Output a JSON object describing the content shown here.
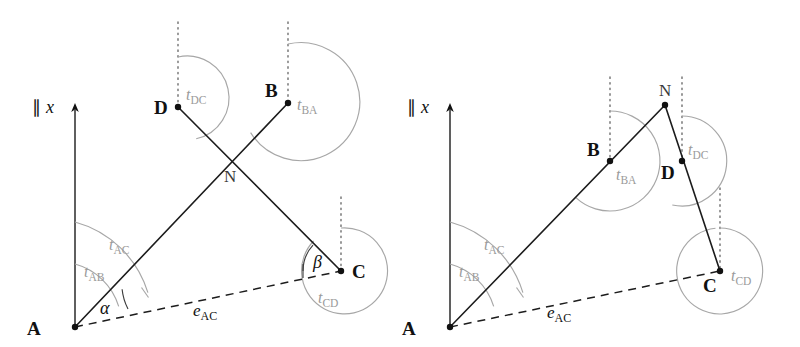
{
  "figure": {
    "background_color": "#ffffff",
    "line_color": "#1c1c1c",
    "arc_color": "#a7a7a7",
    "label_gray": "#9a9a9a",
    "panel_count": 2
  },
  "panels": [
    {
      "id": "left",
      "name": "left-panel",
      "axis_label": {
        "parallel_symbol": "∥",
        "variable": "x"
      },
      "points": [
        {
          "id": "A",
          "label": "A",
          "x": 75,
          "y": 327
        },
        {
          "id": "B",
          "label": "B",
          "x": 288,
          "y": 103
        },
        {
          "id": "C",
          "label": "C",
          "x": 341,
          "y": 271
        },
        {
          "id": "D",
          "label": "D",
          "x": 178,
          "y": 107
        },
        {
          "id": "N",
          "label": "N",
          "x": 232,
          "y": 162
        }
      ],
      "segments": [
        {
          "id": "AC",
          "from": "A",
          "to": "C",
          "style": "solid"
        },
        {
          "id": "DB_through_N",
          "from": "D",
          "to": "C",
          "style": "solid"
        },
        {
          "id": "AB",
          "from": "A",
          "to": "B",
          "style": "solid"
        },
        {
          "id": "eAC",
          "from": "A",
          "to": "C",
          "style": "dashed"
        }
      ],
      "angle_labels": [
        {
          "id": "tAB",
          "t": "t",
          "sub": "AB"
        },
        {
          "id": "tAC",
          "t": "t",
          "sub": "AC"
        },
        {
          "id": "tDC",
          "t": "t",
          "sub": "DC"
        },
        {
          "id": "tBA",
          "t": "t",
          "sub": "BA"
        },
        {
          "id": "tCD",
          "t": "t",
          "sub": "CD"
        }
      ],
      "greek_labels": [
        {
          "id": "alpha",
          "symbol": "α"
        },
        {
          "id": "beta",
          "symbol": "β"
        }
      ],
      "distance_label": {
        "id": "eAC",
        "e": "e",
        "sub": "AC"
      }
    },
    {
      "id": "right",
      "name": "right-panel",
      "axis_label": {
        "parallel_symbol": "∥",
        "variable": "x"
      },
      "points": [
        {
          "id": "A",
          "label": "A",
          "x": 450,
          "y": 327
        },
        {
          "id": "B",
          "label": "B",
          "x": 610,
          "y": 161
        },
        {
          "id": "C",
          "label": "C",
          "x": 720,
          "y": 271
        },
        {
          "id": "D",
          "label": "D",
          "x": 682,
          "y": 161
        },
        {
          "id": "N",
          "label": "N",
          "x": 665,
          "y": 105
        }
      ],
      "segments": [
        {
          "id": "AN",
          "from": "A",
          "to": "N",
          "style": "solid"
        },
        {
          "id": "NC",
          "from": "N",
          "to": "C",
          "style": "solid"
        },
        {
          "id": "eAC",
          "from": "A",
          "to": "C",
          "style": "dashed"
        }
      ],
      "angle_labels": [
        {
          "id": "tAB",
          "t": "t",
          "sub": "AB"
        },
        {
          "id": "tAC",
          "t": "t",
          "sub": "AC"
        },
        {
          "id": "tBA",
          "t": "t",
          "sub": "BA"
        },
        {
          "id": "tDC",
          "t": "t",
          "sub": "DC"
        },
        {
          "id": "tCD",
          "t": "t",
          "sub": "CD"
        }
      ],
      "distance_label": {
        "id": "eAC",
        "e": "e",
        "sub": "AC"
      }
    }
  ]
}
